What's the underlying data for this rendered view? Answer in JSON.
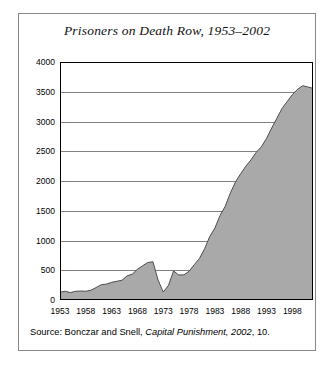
{
  "figure": {
    "title": "Prisoners on Death Row, 1953–2002",
    "source_prefix": "Source: Bonczar and Snell, ",
    "source_italic": "Capital Punishment, 2002",
    "source_suffix": ", 10."
  },
  "style": {
    "area_fill": "#a9a9a9",
    "area_stroke": "#4d4d4d",
    "axis_color": "#000000",
    "grid_color": "#808080",
    "frame_color": "#888888"
  },
  "chart_data": {
    "type": "area",
    "title": "Prisoners on Death Row, 1953–2002",
    "xlabel": "",
    "ylabel": "",
    "xlim": [
      1953,
      2002
    ],
    "ylim": [
      0,
      4000
    ],
    "ytick_step": 500,
    "xtick_step": 5,
    "grid": true,
    "legend": "none",
    "yticks": [
      0,
      500,
      1000,
      1500,
      2000,
      2500,
      3000,
      3500,
      4000
    ],
    "ytick_labels": [
      "0",
      "500",
      "1000",
      "1500",
      "2000",
      "2500",
      "3000",
      "3500",
      "4000"
    ],
    "xticks": [
      1953,
      1958,
      1963,
      1968,
      1973,
      1978,
      1983,
      1988,
      1993,
      1998
    ],
    "xtick_labels": [
      "1953",
      "1958",
      "1963",
      "1968",
      "1973",
      "1978",
      "1983",
      "1988",
      "1993",
      "1998"
    ],
    "x": [
      1953,
      1954,
      1955,
      1956,
      1957,
      1958,
      1959,
      1960,
      1961,
      1962,
      1963,
      1964,
      1965,
      1966,
      1967,
      1968,
      1969,
      1970,
      1971,
      1972,
      1973,
      1974,
      1975,
      1976,
      1977,
      1978,
      1979,
      1980,
      1981,
      1982,
      1983,
      1984,
      1985,
      1986,
      1987,
      1988,
      1989,
      1990,
      1991,
      1992,
      1993,
      1994,
      1995,
      1996,
      1997,
      1998,
      1999,
      2000,
      2001,
      2002
    ],
    "values": [
      131,
      147,
      125,
      146,
      151,
      147,
      164,
      210,
      257,
      267,
      297,
      315,
      331,
      406,
      435,
      517,
      575,
      631,
      642,
      334,
      134,
      244,
      488,
      420,
      423,
      482,
      593,
      697,
      860,
      1066,
      1209,
      1420,
      1575,
      1800,
      1984,
      2124,
      2250,
      2356,
      2482,
      2575,
      2716,
      2890,
      3054,
      3219,
      3335,
      3452,
      3540,
      3601,
      3581,
      3557
    ],
    "series": [
      {
        "name": "Prisoners on death row",
        "values": [
          131,
          147,
          125,
          146,
          151,
          147,
          164,
          210,
          257,
          267,
          297,
          315,
          331,
          406,
          435,
          517,
          575,
          631,
          642,
          334,
          134,
          244,
          488,
          420,
          423,
          482,
          593,
          697,
          860,
          1066,
          1209,
          1420,
          1575,
          1800,
          1984,
          2124,
          2250,
          2356,
          2482,
          2575,
          2716,
          2890,
          3054,
          3219,
          3335,
          3452,
          3540,
          3601,
          3581,
          3557
        ]
      }
    ]
  }
}
